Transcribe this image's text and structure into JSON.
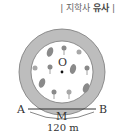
{
  "header": {
    "prefix": "| 지학사 ",
    "highlight": "유사",
    "suffix": " |"
  },
  "diagram": {
    "center_label": "O",
    "point_a": "A",
    "point_b": "B",
    "point_m": "M",
    "chord_length": "120 m",
    "colors": {
      "ring": "#b9b9b9",
      "inner": "#ffffff",
      "stroke": "#555555",
      "flower": "#8a8a8a"
    }
  }
}
